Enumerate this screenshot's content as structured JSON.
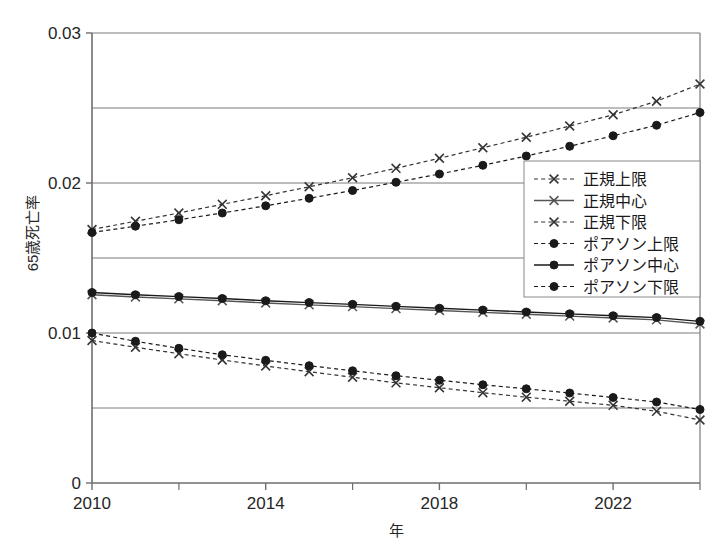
{
  "chart_data": {
    "type": "line",
    "title": "",
    "xlabel": "年",
    "ylabel": "65歳死亡率",
    "x": [
      2010,
      2011,
      2012,
      2013,
      2014,
      2015,
      2016,
      2017,
      2018,
      2019,
      2020,
      2021,
      2022,
      2023,
      2024
    ],
    "xlim": [
      2010,
      2024
    ],
    "ylim": [
      0,
      0.03
    ],
    "xticks": [
      2010,
      2014,
      2018,
      2022
    ],
    "xtick_labels": [
      "2010",
      "2014",
      "2018",
      "2022"
    ],
    "xtick_minor": [
      2012,
      2016,
      2020,
      2024
    ],
    "yticks": [
      0,
      0.01,
      0.02,
      0.03
    ],
    "ytick_labels": [
      "0",
      "0.01",
      "0.02",
      "0.03"
    ],
    "gridlines_y": [
      0.005,
      0.01,
      0.015,
      0.02,
      0.025
    ],
    "grid": true,
    "legend_position": "center-right",
    "series": [
      {
        "name": "正規上限",
        "marker": "x",
        "linestyle": "dashed",
        "color": "#333333",
        "values": [
          0.0169,
          0.01745,
          0.018,
          0.01858,
          0.01915,
          0.01975,
          0.02035,
          0.02098,
          0.02165,
          0.02235,
          0.02305,
          0.0238,
          0.02455,
          0.02545,
          0.0266
        ]
      },
      {
        "name": "正規中心",
        "marker": "x",
        "linestyle": "solid",
        "color": "#555555",
        "values": [
          0.01255,
          0.0124,
          0.01228,
          0.01215,
          0.012,
          0.01188,
          0.01176,
          0.01163,
          0.0115,
          0.01138,
          0.01125,
          0.01113,
          0.011,
          0.01088,
          0.0106
        ]
      },
      {
        "name": "正規下限",
        "marker": "x",
        "linestyle": "dashed",
        "color": "#333333",
        "values": [
          0.0095,
          0.00905,
          0.00862,
          0.0082,
          0.0078,
          0.00742,
          0.00705,
          0.00668,
          0.00635,
          0.00602,
          0.00572,
          0.00545,
          0.00518,
          0.00478,
          0.0042
        ]
      },
      {
        "name": "ポアソン上限",
        "marker": "circle",
        "linestyle": "dashed",
        "color": "#1a1a1a",
        "values": [
          0.0167,
          0.01712,
          0.01755,
          0.018,
          0.01848,
          0.01898,
          0.0195,
          0.02005,
          0.0206,
          0.02118,
          0.0218,
          0.02245,
          0.02315,
          0.02385,
          0.0247
        ]
      },
      {
        "name": "ポアソン中心",
        "marker": "circle",
        "linestyle": "solid",
        "color": "#1a1a1a",
        "values": [
          0.0127,
          0.01255,
          0.01243,
          0.0123,
          0.01215,
          0.01203,
          0.01191,
          0.01178,
          0.01165,
          0.01153,
          0.0114,
          0.01128,
          0.01115,
          0.01103,
          0.01078
        ]
      },
      {
        "name": "ポアソン下限",
        "marker": "circle",
        "linestyle": "dashed",
        "color": "#1a1a1a",
        "values": [
          0.01,
          0.00945,
          0.00898,
          0.00855,
          0.00818,
          0.00782,
          0.00748,
          0.00715,
          0.00685,
          0.00655,
          0.00628,
          0.006,
          0.0057,
          0.0054,
          0.0049
        ]
      }
    ]
  },
  "legend": {
    "items": [
      {
        "label": "正規上限"
      },
      {
        "label": "正規中心"
      },
      {
        "label": "正規下限"
      },
      {
        "label": "ポアソン上限"
      },
      {
        "label": "ポアソン中心"
      },
      {
        "label": "ポアソン下限"
      }
    ]
  },
  "colors": {
    "axis": "#6e6e6e",
    "grid": "#7a7a7a",
    "series_dark": "#1a1a1a",
    "series_gray": "#555555",
    "background": "#ffffff"
  },
  "footer": {
    "ghost_text": ""
  }
}
